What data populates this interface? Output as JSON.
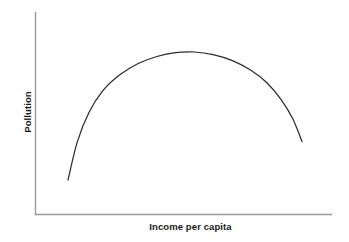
{
  "chart_data": {
    "type": "line",
    "title": "",
    "subtitle": "",
    "xlabel": "Income per capita",
    "ylabel": "Pollution",
    "xlim": [
      0,
      1
    ],
    "ylim": [
      0,
      1
    ],
    "grid": false,
    "legend": null,
    "axis_ticks": {
      "x": [],
      "y": []
    },
    "annotations": [],
    "series": [
      {
        "name": "Environmental Kuznets Curve",
        "shape": "inverted-u",
        "color": "#2b2b2b",
        "x": [
          0.0,
          0.04,
          0.09,
          0.15,
          0.22,
          0.3,
          0.38,
          0.46,
          0.54,
          0.62,
          0.7,
          0.78,
          0.85,
          0.91,
          0.96,
          1.0
        ],
        "y": [
          0.0,
          0.3,
          0.53,
          0.7,
          0.82,
          0.91,
          0.965,
          0.995,
          1.0,
          0.98,
          0.935,
          0.86,
          0.76,
          0.63,
          0.48,
          0.3
        ],
        "peak": {
          "x": 0.52,
          "y": 1.0
        }
      }
    ]
  },
  "axes": {
    "x_label": "Income per capita",
    "y_label": "Pollution",
    "line_color": "#999999",
    "origin_px": {
      "x": 35,
      "y": 215
    },
    "x_end_px": 332,
    "y_top_px": 12
  },
  "style": {
    "background": "#ffffff",
    "curve_color": "#2b2b2b",
    "label_color": "#1a1a1a"
  }
}
